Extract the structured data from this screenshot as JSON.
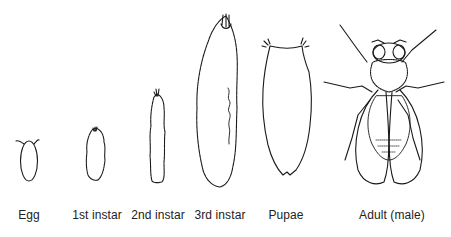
{
  "stages": [
    {
      "id": "egg",
      "label": "Egg"
    },
    {
      "id": "first-instar",
      "label": "1st instar"
    },
    {
      "id": "second-instar",
      "label": "2nd instar"
    },
    {
      "id": "third-instar",
      "label": "3rd instar"
    },
    {
      "id": "pupae",
      "label": "Pupae"
    },
    {
      "id": "adult",
      "label": "Adult (male)"
    }
  ],
  "colors": {
    "line": "#1a1a1a",
    "background": "#ffffff",
    "label": "#222222"
  }
}
